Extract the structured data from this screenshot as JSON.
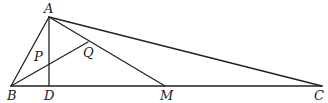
{
  "figure": {
    "type": "geometry-triangle",
    "points": {
      "A": {
        "label": "A",
        "x": 49,
        "y": 17
      },
      "B": {
        "label": "B",
        "x": 11,
        "y": 86
      },
      "C": {
        "label": "C",
        "x": 322,
        "y": 86
      },
      "D": {
        "label": "D",
        "x": 49,
        "y": 86
      },
      "M": {
        "label": "M",
        "x": 165,
        "y": 86
      },
      "P": {
        "label": "P",
        "x": 49,
        "y": 63
      },
      "Q": {
        "label": "Q",
        "x": 88,
        "y": 42
      }
    },
    "segments": [
      "AB",
      "AC",
      "BC",
      "AD",
      "AM",
      "BQ"
    ],
    "stroke_color": "#222222"
  }
}
